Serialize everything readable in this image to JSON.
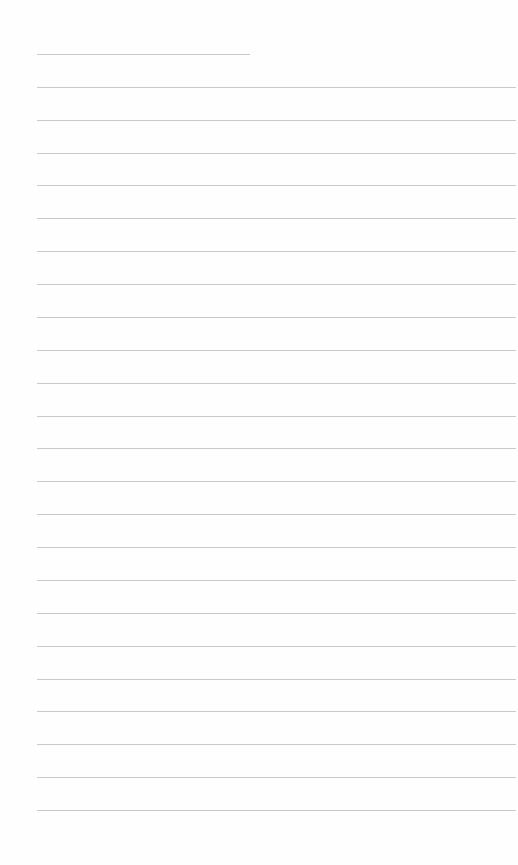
{
  "page": {
    "type": "lined-paper",
    "background_color": "#fefefe",
    "line_color": "#c9c9c9",
    "line_left": 37,
    "first_line_y": 54,
    "line_spacing": 32.87,
    "line_count": 24,
    "first_line_right": 250,
    "line_right": 516
  }
}
